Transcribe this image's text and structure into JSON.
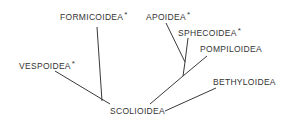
{
  "diagram": {
    "type": "phylogenetic-tree",
    "root": {
      "label": "SCOLIOIDEA",
      "marked": false
    },
    "taxa": [
      {
        "id": "formicoidea",
        "label": "FORMICOIDEA",
        "marked": true
      },
      {
        "id": "vespoidea",
        "label": "VESPOIDEA",
        "marked": true
      },
      {
        "id": "apoidea",
        "label": "APOIDEA",
        "marked": true
      },
      {
        "id": "sphecoidea",
        "label": "SPHECOIDEA",
        "marked": true
      },
      {
        "id": "pompiloidea",
        "label": "POMPILOIDEA",
        "marked": false
      },
      {
        "id": "bethyloidea",
        "label": "BETHYLOIDEA",
        "marked": false
      }
    ],
    "marker": "*"
  },
  "labels": {
    "formicoidea": "FORMICOIDEA",
    "vespoidea": "VESPOIDEA",
    "apoidea": "APOIDEA",
    "sphecoidea": "SPHECOIDEA",
    "pompiloidea": "POMPILOIDEA",
    "bethyloidea": "BETHYLOIDEA",
    "scolioidea": "SCOLIOIDEA",
    "marker": "*"
  }
}
